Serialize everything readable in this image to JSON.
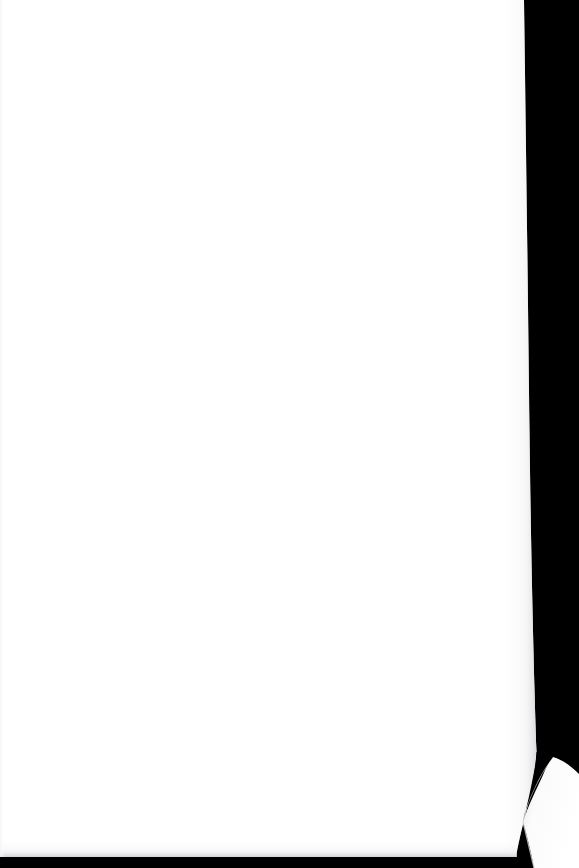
{
  "document": {
    "kind": "scanned-page-photograph",
    "orientation": "portrait",
    "page_content_text": "",
    "page_is_blank": true,
    "visible_text_count": "0"
  },
  "colors": {
    "background": "#000000",
    "page_surface": "#ffffff",
    "page_shadow_edge": "#e8e8ea",
    "curl_shade": "#f2f2f4",
    "gap_shadow": "#000000"
  },
  "geometry": {
    "canvas_width": "579",
    "canvas_height": "868",
    "page_top_edge_y": "0",
    "page_left_edge_x": "0",
    "page_right_edge_top_x": "524",
    "page_right_edge_bottom_x": "537",
    "page_bottom_edge_y": "857",
    "curl_start_y": "755",
    "curl_gap_close_y": "802"
  },
  "regions": {
    "backdrop_label": "black backdrop",
    "page_label": "blank white page",
    "curl_label": "folded bottom-right page corner",
    "gap_label": "shadow gap behind folded corner",
    "bottom_shadow_label": "bottom edge shadow band",
    "left_seam_label": "left edge scan seam"
  }
}
